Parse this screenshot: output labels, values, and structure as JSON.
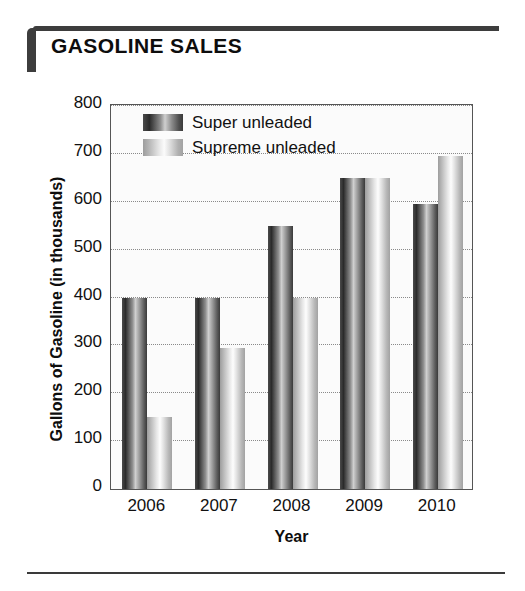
{
  "title": "GASOLINE SALES",
  "chart_data": {
    "type": "bar",
    "title": "GASOLINE SALES",
    "xlabel": "Year",
    "ylabel": "Gallons of Gasoline (in thousands)",
    "categories": [
      "2006",
      "2007",
      "2008",
      "2009",
      "2010"
    ],
    "series": [
      {
        "name": "Super unleaded",
        "values": [
          400,
          400,
          550,
          650,
          595
        ],
        "color": "#3a3a3a"
      },
      {
        "name": "Supreme unleaded",
        "values": [
          150,
          295,
          400,
          650,
          695
        ],
        "color": "#cccccc"
      }
    ],
    "yticks": [
      "800",
      "700",
      "600",
      "500",
      "400",
      "300",
      "200",
      "100",
      "0"
    ],
    "ylim": [
      0,
      800
    ],
    "grid": true,
    "legend_position": "top-left"
  }
}
